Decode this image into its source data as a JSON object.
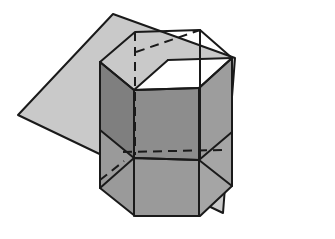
{
  "figure": {
    "type": "geometric-line-drawing",
    "canvas": {
      "width": 335,
      "height": 239,
      "background": "#ffffff"
    },
    "colors": {
      "background": "#ffffff",
      "plane_fill": "#c9c9c9",
      "cube_face_front": "#8d8d8d",
      "cube_face_left": "#7f7f7f",
      "cube_face_top_white": "#ffffff",
      "prism_shaded": "#b4b4b4",
      "prism_shaded_dark": "#9a9a9a",
      "stroke": "#1a1a1a"
    },
    "stroke_widths": {
      "solid": 2.0,
      "dashed": 2.0,
      "thin": 1.6
    },
    "dash_pattern": "9,6",
    "shapes": [
      {
        "name": "cutting-plane",
        "kind": "parallelogram",
        "fill": "#c9c9c9",
        "points": "113,14 235,58 223,213 18,115"
      },
      {
        "name": "hexagonal-prism",
        "kind": "prism",
        "top_face_points": "100,62 135,32 200,30 232,58 199,88 134,90",
        "bottom_face_points": "100,188 135,216 200,216 232,186 199,160 134,158",
        "vertical_edges": [
          "100,62 100,188",
          "134,90 134,216",
          "199,88 199,216",
          "232,58 232,186",
          "135,32 135,158",
          "200,30 200,158"
        ]
      },
      {
        "name": "inner-cube",
        "kind": "cube",
        "front_face_points": "134,90 199,88 199,160 134,158",
        "top_face_points": "134,90 168,60 232,58 199,88",
        "left_face_points": "100,62 134,90 134,158 100,130",
        "hidden_edges": [
          "135,32 135,155",
          "124,152 219,150",
          "100,178 122,160"
        ]
      }
    ],
    "labels": [],
    "annotations": []
  }
}
